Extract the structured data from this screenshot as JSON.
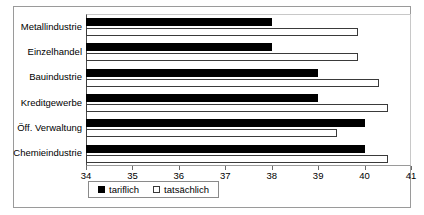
{
  "chart_data": {
    "type": "bar",
    "orientation": "horizontal",
    "title": "",
    "subtitle": "",
    "xlabel": "",
    "ylabel": "",
    "xlim": [
      34,
      41
    ],
    "xticks": [
      34,
      35,
      36,
      37,
      38,
      39,
      40,
      41
    ],
    "xtick_labels": [
      "34",
      "35",
      "36",
      "37",
      "38",
      "39",
      "40",
      "41"
    ],
    "grid": false,
    "legend_position": "bottom-left",
    "categories": [
      "Metallindustrie",
      "Einzelhandel",
      "Bauindustrie",
      "Kreditgewerbe",
      "Öff. Verwaltung",
      "Chemieindustrie"
    ],
    "series": [
      {
        "name": "tariflich",
        "color": "#000000",
        "style": "filled",
        "values": [
          38.0,
          38.0,
          39.0,
          39.0,
          40.0,
          40.0
        ]
      },
      {
        "name": "tatsächlich",
        "color": "#ffffff",
        "style": "hollow",
        "values": [
          39.85,
          39.85,
          40.3,
          40.5,
          39.4,
          40.5
        ]
      }
    ]
  },
  "legend": {
    "entries": [
      {
        "label": "tariflich",
        "swatch": "filled"
      },
      {
        "label": "tatsächlich",
        "swatch": "hollow"
      }
    ]
  }
}
